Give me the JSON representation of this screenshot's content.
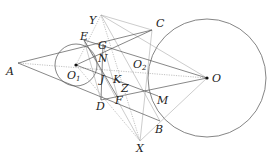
{
  "diagram": {
    "type": "geometry",
    "circles": [
      {
        "name": "O1",
        "cx": 76,
        "cy": 65,
        "r": 21
      },
      {
        "name": "O",
        "cx": 207,
        "cy": 78,
        "r": 59
      }
    ],
    "points": {
      "A": {
        "x": 18,
        "y": 63,
        "label": "A",
        "lx": 6,
        "ly": 75
      },
      "Y": {
        "x": 101,
        "y": 15,
        "label": "Y",
        "lx": 89,
        "ly": 24
      },
      "C": {
        "x": 152,
        "y": 30,
        "label": "C",
        "lx": 156,
        "ly": 27
      },
      "E": {
        "x": 84,
        "y": 40,
        "label": "E",
        "lx": 80,
        "ly": 40
      },
      "G": {
        "x": 103,
        "y": 44,
        "label": "G",
        "lx": 98,
        "ly": 49
      },
      "N": {
        "x": 100,
        "y": 58,
        "label": "N",
        "lx": 98,
        "ly": 62
      },
      "O1": {
        "x": 76,
        "y": 65,
        "label": "O",
        "sub": "1",
        "lx": 67,
        "ly": 79
      },
      "O2": {
        "x": 138,
        "y": 62,
        "label": "O",
        "sub": "2",
        "lx": 133,
        "ly": 68
      },
      "O": {
        "x": 207,
        "y": 78,
        "label": "O",
        "lx": 212,
        "ly": 82
      },
      "J": {
        "x": 104,
        "y": 74,
        "label": "J",
        "lx": 100,
        "ly": 83
      },
      "K": {
        "x": 117,
        "y": 76,
        "label": "K",
        "lx": 113,
        "ly": 83
      },
      "Z": {
        "x": 124,
        "y": 86,
        "label": "Z",
        "lx": 121,
        "ly": 92
      },
      "D": {
        "x": 101,
        "y": 100,
        "label": "D",
        "lx": 96,
        "ly": 110
      },
      "F": {
        "x": 118,
        "y": 98,
        "label": "F",
        "lx": 115,
        "ly": 104
      },
      "M": {
        "x": 158,
        "y": 96,
        "label": "M",
        "lx": 157,
        "ly": 104
      },
      "B": {
        "x": 160,
        "y": 121,
        "label": "B",
        "lx": 155,
        "ly": 133
      },
      "X": {
        "x": 140,
        "y": 141,
        "label": "X",
        "lx": 136,
        "ly": 152
      }
    },
    "solid_lines": [
      [
        "A",
        "C"
      ],
      [
        "A",
        "B"
      ],
      [
        "O",
        "E"
      ],
      [
        "O",
        "D"
      ],
      [
        "E",
        "F"
      ],
      [
        "D",
        "G"
      ],
      [
        "O1",
        "C"
      ],
      [
        "O1",
        "M"
      ]
    ],
    "light_lines": [
      [
        "Y",
        "B"
      ],
      [
        "Y",
        "C"
      ],
      [
        "X",
        "C"
      ],
      [
        "X",
        "E"
      ],
      [
        "X",
        "O"
      ],
      [
        "Y",
        "O"
      ],
      [
        "E",
        "D"
      ],
      [
        "G",
        "F"
      ]
    ],
    "dotted_lines": [
      [
        "A",
        "O"
      ],
      [
        "Y",
        "X"
      ],
      [
        "O1",
        "X"
      ],
      [
        "O1",
        "Y"
      ]
    ]
  }
}
